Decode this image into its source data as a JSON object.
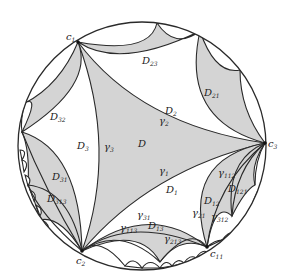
{
  "figure": {
    "type": "hyperbolic-disk-tessellation",
    "colors": {
      "shade": "#d4d4d4",
      "line": "#2a2a2a",
      "background": "#ffffff"
    },
    "disk": {
      "cx": 142,
      "cy": 146,
      "r": 124
    }
  },
  "cusps": {
    "c1": {
      "label": "c",
      "sub": "1"
    },
    "c2": {
      "label": "c",
      "sub": "2"
    },
    "c3": {
      "label": "c",
      "sub": "3"
    },
    "c11": {
      "label": "c",
      "sub": "11"
    }
  },
  "regions": {
    "D": {
      "label": "D",
      "sub": ""
    },
    "D1": {
      "label": "D",
      "sub": "1"
    },
    "D2": {
      "label": "D",
      "sub": "2"
    },
    "D3": {
      "label": "D",
      "sub": "3"
    },
    "D12": {
      "label": "D",
      "sub": "12"
    },
    "D13": {
      "label": "D",
      "sub": "13"
    },
    "D21": {
      "label": "D",
      "sub": "21"
    },
    "D23": {
      "label": "D",
      "sub": "23"
    },
    "D31": {
      "label": "D",
      "sub": "31"
    },
    "D32": {
      "label": "D",
      "sub": "32"
    },
    "D121": {
      "label": "D",
      "sub": "121"
    },
    "D313": {
      "label": "D",
      "sub": "313"
    }
  },
  "arcs": {
    "g1": {
      "label": "γ",
      "sub": "1"
    },
    "g2": {
      "label": "γ",
      "sub": "2"
    },
    "g3": {
      "label": "γ",
      "sub": "3"
    },
    "g21": {
      "label": "γ",
      "sub": "21"
    },
    "g31": {
      "label": "γ",
      "sub": "31"
    },
    "g112": {
      "label": "γ",
      "sub": "112"
    },
    "g113": {
      "label": "γ",
      "sub": "113"
    },
    "g213": {
      "label": "γ",
      "sub": "213"
    },
    "g312": {
      "label": "γ",
      "sub": "312"
    }
  }
}
